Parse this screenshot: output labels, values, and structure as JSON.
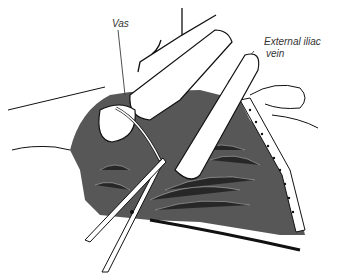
{
  "figure": {
    "type": "surgical line illustration",
    "labels": [
      {
        "id": "vas",
        "text": "Vas"
      },
      {
        "id": "external_iliac_vein",
        "line1": "External iliac",
        "line2": "vein"
      }
    ],
    "elements": [
      "surgeon-fingers",
      "scissors",
      "vas-deferens",
      "incision-tissue",
      "external-iliac-vein"
    ],
    "colors": {
      "ink": "#111111",
      "background": "#ffffff",
      "label": "#333333"
    }
  }
}
